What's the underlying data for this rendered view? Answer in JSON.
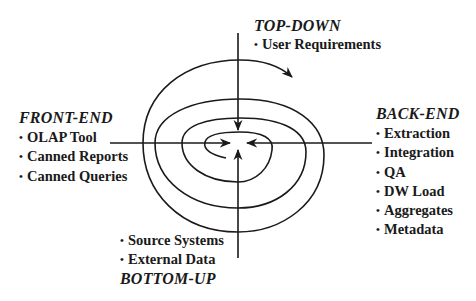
{
  "diagram": {
    "type": "spiral-quadrant",
    "center_arrows": [
      "top",
      "left",
      "right",
      "bottom"
    ],
    "spiral_direction": "clockwise-outward",
    "colors": {
      "line": "#1a1a1a",
      "background": "#ffffff",
      "text": "#1a1a1a"
    }
  },
  "top": {
    "heading": "TOP-DOWN",
    "items": [
      "User Requirements"
    ]
  },
  "left": {
    "heading": "FRONT-END",
    "items": [
      "OLAP Tool",
      "Canned Reports",
      "Canned Queries"
    ]
  },
  "right": {
    "heading": "BACK-END",
    "items": [
      "Extraction",
      "Integration",
      "QA",
      "DW Load",
      "Aggregates",
      "Metadata"
    ]
  },
  "bottom": {
    "heading": "BOTTOM-UP",
    "items": [
      "Source Systems",
      "External Data"
    ]
  },
  "bullet": "•"
}
